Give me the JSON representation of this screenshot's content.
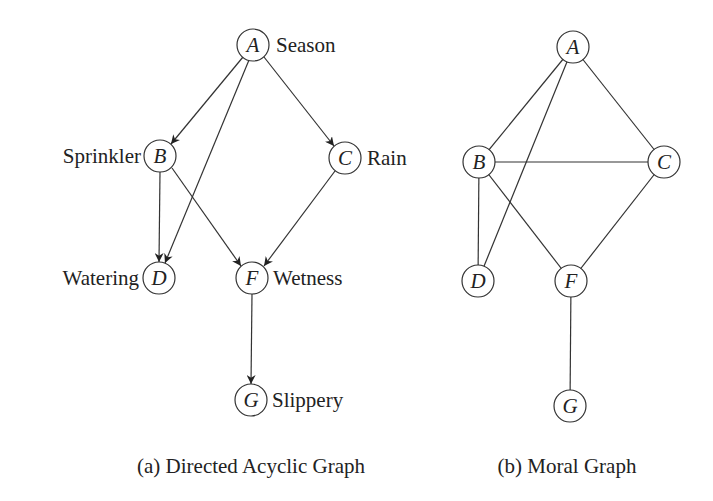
{
  "dag": {
    "caption": "(a) Directed Acyclic Graph",
    "nodes": {
      "A": {
        "letter": "A",
        "label": "Season"
      },
      "B": {
        "letter": "B",
        "label": "Sprinkler"
      },
      "C": {
        "letter": "C",
        "label": "Rain"
      },
      "D": {
        "letter": "D",
        "label": "Watering"
      },
      "F": {
        "letter": "F",
        "label": "Wetness"
      },
      "G": {
        "letter": "G",
        "label": "Slippery"
      }
    },
    "edges": [
      {
        "from": "A",
        "to": "B",
        "directed": true
      },
      {
        "from": "A",
        "to": "C",
        "directed": true
      },
      {
        "from": "A",
        "to": "D",
        "directed": true
      },
      {
        "from": "B",
        "to": "D",
        "directed": true
      },
      {
        "from": "B",
        "to": "F",
        "directed": true
      },
      {
        "from": "C",
        "to": "F",
        "directed": true
      },
      {
        "from": "F",
        "to": "G",
        "directed": true
      }
    ]
  },
  "moral": {
    "caption": "(b) Moral Graph",
    "nodes": {
      "A": {
        "letter": "A"
      },
      "B": {
        "letter": "B"
      },
      "C": {
        "letter": "C"
      },
      "D": {
        "letter": "D"
      },
      "F": {
        "letter": "F"
      },
      "G": {
        "letter": "G"
      }
    },
    "edges": [
      {
        "from": "A",
        "to": "B",
        "directed": false
      },
      {
        "from": "A",
        "to": "C",
        "directed": false
      },
      {
        "from": "A",
        "to": "D",
        "directed": false
      },
      {
        "from": "B",
        "to": "C",
        "directed": false
      },
      {
        "from": "B",
        "to": "D",
        "directed": false
      },
      {
        "from": "B",
        "to": "F",
        "directed": false
      },
      {
        "from": "C",
        "to": "F",
        "directed": false
      },
      {
        "from": "F",
        "to": "G",
        "directed": false
      }
    ]
  }
}
